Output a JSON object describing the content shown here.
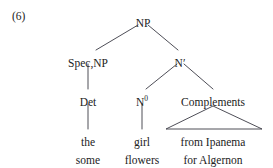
{
  "figure": {
    "example_number": "(6)",
    "kind": "x-bar-syntax-tree",
    "background_color": "#ffffff",
    "ink_color": "#222222"
  },
  "tree": {
    "root": {
      "label": "NP",
      "x": 143,
      "y": 18
    },
    "nodes": [
      {
        "id": "spec-np",
        "label": "Spec,NP",
        "x": 88,
        "y": 58
      },
      {
        "id": "n-bar",
        "label": "N′",
        "x": 180,
        "y": 58
      },
      {
        "id": "det",
        "label": "Det",
        "x": 88,
        "y": 97
      },
      {
        "id": "n-zero",
        "label": "N",
        "sup": "0",
        "x": 142,
        "y": 97
      },
      {
        "id": "complements",
        "label": "Complements",
        "x": 213,
        "y": 97
      }
    ],
    "leaves": [
      {
        "id": "det-line-1",
        "label": "the",
        "x": 88,
        "y": 137
      },
      {
        "id": "det-line-2",
        "label": "some",
        "x": 88,
        "y": 155
      },
      {
        "id": "noun-line-1",
        "label": "girl",
        "x": 142,
        "y": 137
      },
      {
        "id": "noun-line-2",
        "label": "flowers",
        "x": 142,
        "y": 155
      },
      {
        "id": "complement-line-1",
        "label": "from Ipanema",
        "x": 213,
        "y": 137
      },
      {
        "id": "complement-line-2",
        "label": "for Algernon",
        "x": 213,
        "y": 155
      }
    ],
    "edges": [
      {
        "id": "np-to-spec",
        "type": "branch",
        "x1": 138,
        "y1": 25,
        "x2": 96,
        "y2": 50
      },
      {
        "id": "np-to-nbar",
        "type": "branch",
        "x1": 148,
        "y1": 25,
        "x2": 178,
        "y2": 50
      },
      {
        "id": "spec-to-det",
        "type": "vertical",
        "x1": 88,
        "y1": 64,
        "x2": 88,
        "y2": 89
      },
      {
        "id": "nbar-to-nzero",
        "type": "branch",
        "x1": 177,
        "y1": 64,
        "x2": 146,
        "y2": 89
      },
      {
        "id": "nbar-to-complements",
        "type": "branch",
        "x1": 184,
        "y1": 64,
        "x2": 213,
        "y2": 89
      },
      {
        "id": "det-to-word",
        "type": "vertical",
        "x1": 88,
        "y1": 104,
        "x2": 88,
        "y2": 129
      },
      {
        "id": "nzero-to-word",
        "type": "vertical",
        "x1": 142,
        "y1": 104,
        "x2": 142,
        "y2": 129
      }
    ],
    "triangle": {
      "id": "complements-triangle",
      "apex_x": 213,
      "apex_y": 106,
      "left_x": 166,
      "left_y": 129,
      "right_x": 262,
      "right_y": 129
    }
  }
}
